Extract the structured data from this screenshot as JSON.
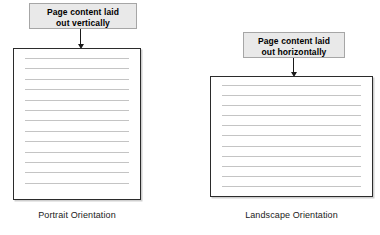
{
  "diagram": {
    "background_color": "#ffffff",
    "callout_fill": "#e9e9e9",
    "callout_border": "#a6a6a6",
    "page_border": "#2b2b2b",
    "content_line_color": "#c4c4c4",
    "arrow_color": "#1a1a1a"
  },
  "portrait": {
    "callout": {
      "line1": "Page content laid",
      "line2": "out vertically"
    },
    "caption": "Portrait Orientation",
    "content_line_count": 13,
    "arrow_direction": "down"
  },
  "landscape": {
    "callout": {
      "line1": "Page content laid",
      "line2": "out horizontally"
    },
    "caption": "Landscape Orientation",
    "content_line_count": 11,
    "arrow_direction": "down"
  }
}
